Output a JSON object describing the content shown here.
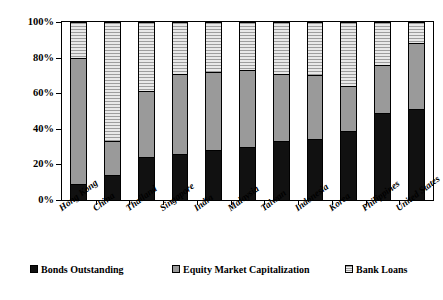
{
  "chart_data": {
    "type": "bar",
    "subtype": "stacked-100-percent",
    "title": "",
    "xlabel": "",
    "ylabel": "",
    "ylim": [
      0,
      100
    ],
    "yticks": [
      "0%",
      "20%",
      "40%",
      "60%",
      "80%",
      "100%"
    ],
    "ytick_values": [
      0,
      20,
      40,
      60,
      80,
      100
    ],
    "grid": false,
    "legend_position": "bottom",
    "categories": [
      "Hong Kong",
      "China",
      "Thailand",
      "Singapore",
      "India",
      "Malaysia",
      "Taiwan",
      "Indonesia",
      "Korea",
      "Philippines",
      "United States"
    ],
    "series": [
      {
        "name": "Bonds Outstanding",
        "color": "#111111",
        "pattern": "solid",
        "values": [
          9,
          14,
          24,
          26,
          28,
          30,
          33,
          34,
          39,
          49,
          51
        ]
      },
      {
        "name": "Equity Market Capitalization",
        "color": "#9a9a9a",
        "pattern": "solid",
        "values": [
          71,
          19,
          37,
          45,
          44,
          43,
          38,
          36,
          25,
          27,
          37
        ]
      },
      {
        "name": "Bank Loans",
        "color": "#dcdcdc",
        "pattern": "horizontal-hatch",
        "values": [
          20,
          67,
          39,
          29,
          28,
          27,
          29,
          30,
          36,
          24,
          12
        ]
      }
    ],
    "cumulative_tops": {
      "bonds": [
        9,
        14,
        24,
        26,
        28,
        30,
        33,
        34,
        39,
        49,
        51
      ],
      "bonds_plus_equity": [
        80,
        33,
        61,
        71,
        72,
        73,
        71,
        70,
        64,
        76,
        88
      ],
      "total": [
        100,
        100,
        100,
        100,
        100,
        100,
        100,
        100,
        100,
        100,
        100
      ]
    }
  },
  "legend": {
    "items": [
      {
        "label": "Bonds Outstanding"
      },
      {
        "label": "Equity Market Capitalization"
      },
      {
        "label": "Bank Loans"
      }
    ]
  }
}
